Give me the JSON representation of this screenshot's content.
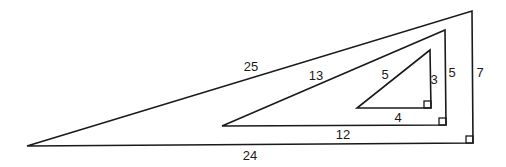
{
  "diagram": {
    "stroke_color": "#1a1a1a",
    "background": "#ffffff",
    "triangles": [
      {
        "name": "outer",
        "triple": [
          7,
          24,
          25
        ],
        "points": [
          [
            27,
            146
          ],
          [
            473,
            143
          ],
          [
            472,
            11
          ]
        ],
        "right_angle": {
          "x": 466,
          "y": 136,
          "size": 7
        },
        "labels": [
          {
            "side": "hypotenuse",
            "text": "25",
            "x": 251,
            "y": 71
          },
          {
            "side": "base",
            "text": "24",
            "x": 250,
            "y": 160
          },
          {
            "side": "height",
            "text": "7",
            "x": 480,
            "y": 77
          }
        ]
      },
      {
        "name": "middle",
        "triple": [
          5,
          12,
          13
        ],
        "points": [
          [
            222,
            126
          ],
          [
            446,
            125
          ],
          [
            445,
            30
          ]
        ],
        "right_angle": {
          "x": 439,
          "y": 118,
          "size": 7
        },
        "labels": [
          {
            "side": "hypotenuse",
            "text": "13",
            "x": 316,
            "y": 80
          },
          {
            "side": "base",
            "text": "12",
            "x": 343,
            "y": 139
          },
          {
            "side": "height",
            "text": "5",
            "x": 452,
            "y": 77
          }
        ]
      },
      {
        "name": "inner",
        "triple": [
          3,
          4,
          5
        ],
        "points": [
          [
            357,
            108
          ],
          [
            431,
            108
          ],
          [
            430,
            50
          ]
        ],
        "right_angle": {
          "x": 424,
          "y": 101,
          "size": 7
        },
        "labels": [
          {
            "side": "hypotenuse",
            "text": "5",
            "x": 385,
            "y": 79
          },
          {
            "side": "base",
            "text": "4",
            "x": 398,
            "y": 122
          },
          {
            "side": "height",
            "text": "3",
            "x": 434,
            "y": 84
          }
        ]
      }
    ]
  }
}
